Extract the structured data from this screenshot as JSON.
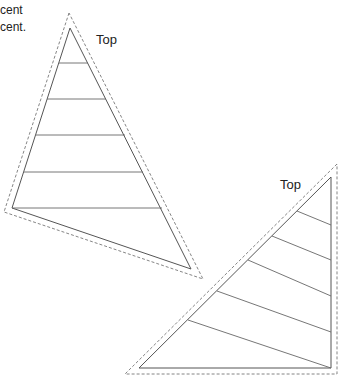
{
  "text_fragments": {
    "top_clipped": "",
    "line1": "cent",
    "line2": "cent."
  },
  "triangles": [
    {
      "name": "triangle-upright",
      "label": "Top",
      "inner": [
        [
          70,
          28
        ],
        [
          12,
          208
        ],
        [
          191,
          269
        ]
      ],
      "outer_dashed": [
        [
          69,
          13
        ],
        [
          4,
          212
        ],
        [
          203,
          279
        ]
      ],
      "stripes": [
        [
          [
            59,
            63
          ],
          [
            88,
            63
          ]
        ],
        [
          [
            47,
            99
          ],
          [
            106,
            99
          ]
        ],
        [
          [
            36,
            135
          ],
          [
            125,
            135
          ]
        ],
        [
          [
            24,
            172
          ],
          [
            143,
            172
          ]
        ],
        [
          [
            12,
            208
          ],
          [
            162,
            208
          ]
        ]
      ]
    },
    {
      "name": "triangle-right",
      "label": "Top",
      "inner": [
        [
          331,
          177
        ],
        [
          139,
          368
        ],
        [
          331,
          368
        ]
      ],
      "outer_dashed": [
        [
          337,
          164
        ],
        [
          125,
          374
        ],
        [
          337,
          374
        ]
      ],
      "stripes": [
        [
          [
            297,
            211
          ],
          [
            331,
            225
          ]
        ],
        [
          [
            272,
            236
          ],
          [
            331,
            260
          ]
        ],
        [
          [
            248,
            260
          ],
          [
            331,
            296
          ]
        ],
        [
          [
            217,
            291
          ],
          [
            331,
            332
          ]
        ],
        [
          [
            188,
            320
          ],
          [
            331,
            368
          ]
        ]
      ]
    }
  ]
}
